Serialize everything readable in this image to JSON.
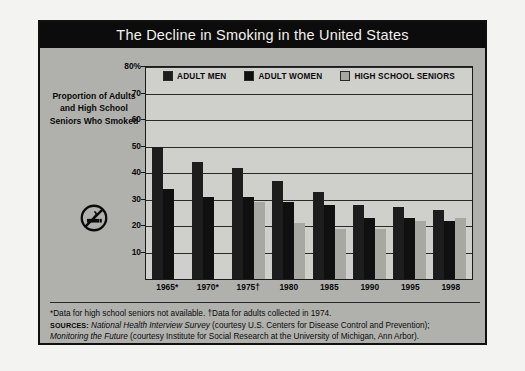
{
  "title": "The Decline in Smoking in the United States",
  "axis_caption": "Proportion of Adults and High School Seniors Who Smoked",
  "icons": {
    "no_smoking": "no-smoking-icon"
  },
  "colors": {
    "title_bar": "#0c0c0c",
    "figure_bg": "#b0b0ad",
    "plot_bg": "#cfcfcb",
    "adult_men": "#1d1d1d",
    "adult_women": "#101010",
    "high_school_seniors": "#a8a8a3"
  },
  "footnotes": {
    "line1": "*Data for high school seniors not available.  †Data for adults collected in 1974.",
    "sources_label": "Sources:",
    "source1_title": "National Health Interview Survey",
    "source1_rest": " (courtesy U.S. Centers for Disease Control and Prevention);",
    "source2_title": "Monitoring the Future",
    "source2_rest": " (courtesy Institute for Social Research at the University of Michigan, Ann Arbor)."
  },
  "chart_data": {
    "type": "bar",
    "title": "The Decline in Smoking in the United States",
    "xlabel": "",
    "ylabel": "Proportion of Adults and High School Seniors Who Smoked",
    "ylim": [
      0,
      80
    ],
    "ytick_labels": [
      "80%",
      "70",
      "60",
      "50",
      "40",
      "30",
      "20",
      "10"
    ],
    "yticks": [
      80,
      70,
      60,
      50,
      40,
      30,
      20,
      10
    ],
    "grid": true,
    "legend_position": "top-center",
    "categories": [
      "1965*",
      "1970*",
      "1975†",
      "1980",
      "1985",
      "1990",
      "1995",
      "1998"
    ],
    "series": [
      {
        "name": "Adult Men",
        "values": [
          50,
          44,
          42,
          37,
          33,
          28,
          27,
          26
        ]
      },
      {
        "name": "Adult Women",
        "values": [
          34,
          31,
          31,
          29,
          28,
          23,
          23,
          22
        ]
      },
      {
        "name": "High School Seniors",
        "values": [
          null,
          null,
          29,
          21,
          19,
          19,
          22,
          23
        ]
      }
    ]
  }
}
